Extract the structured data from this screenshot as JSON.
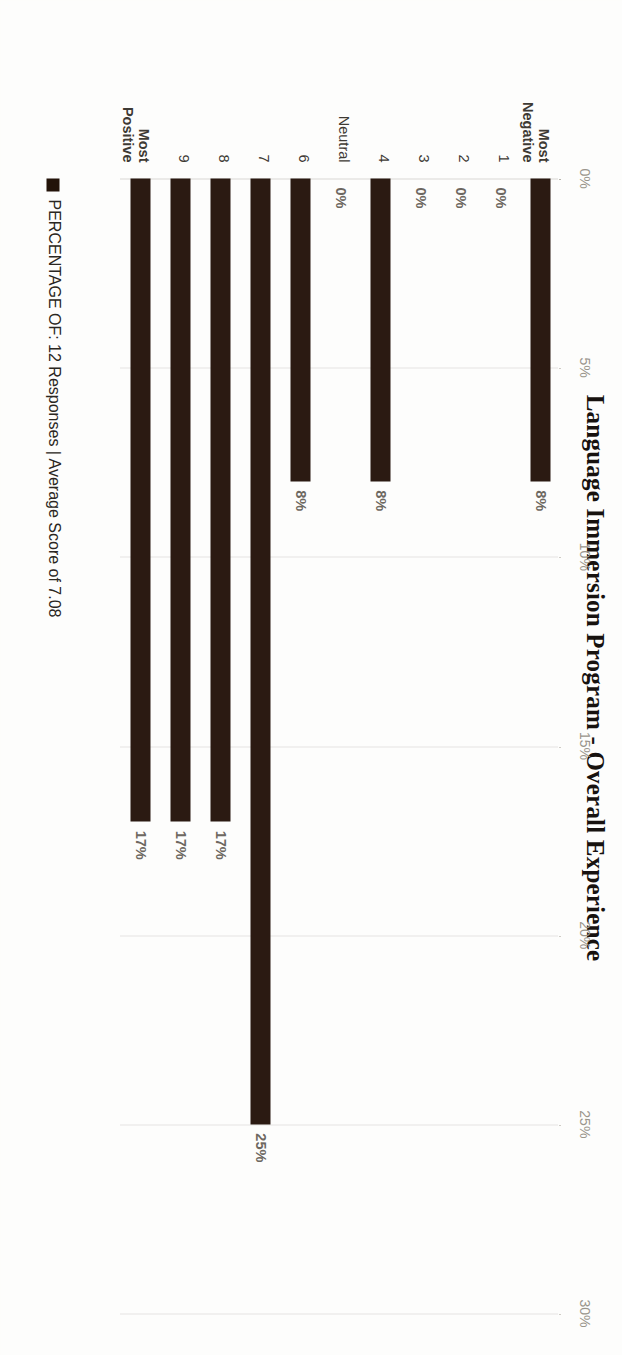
{
  "chart_data": {
    "type": "bar",
    "orientation": "horizontal",
    "title": "Language Immersion Program - Overall Experience",
    "xlabel": "",
    "ylabel": "",
    "xlim": [
      0,
      30
    ],
    "grid": true,
    "legend_position": "bottom-left",
    "categories": [
      "Most\nNegative",
      "1",
      "2",
      "3",
      "4",
      "Neutral",
      "6",
      "7",
      "8",
      "9",
      "Most\nPositive"
    ],
    "values": [
      8,
      0,
      0,
      0,
      8,
      0,
      8,
      25,
      17,
      17,
      17
    ],
    "data_labels": [
      "8%",
      "0%",
      "0%",
      "0%",
      "8%",
      "0%",
      "8%",
      "25%",
      "17%",
      "17%",
      "17%"
    ],
    "xticks": [
      0,
      5,
      10,
      15,
      20,
      25,
      30
    ],
    "xtick_labels": [
      "0%",
      "5%",
      "10%",
      "15%",
      "20%",
      "25%",
      "30%"
    ],
    "series": [
      {
        "name": "PERCENTAGE OF: 12 Responses | Average Score of 7.08",
        "color": "#2b1a12",
        "values": [
          8,
          0,
          0,
          0,
          8,
          0,
          8,
          25,
          17,
          17,
          17
        ]
      }
    ],
    "legend": [
      {
        "label": "PERCENTAGE OF: 12 Responses | Average Score of 7.08",
        "color": "#231309"
      }
    ],
    "annotations": {
      "responses": "12 Responses",
      "average_score": "7.08"
    }
  },
  "colors": {
    "bar": "#2b1a12",
    "gridline": "#cfccc5",
    "tick_text": "#9a958c",
    "label_text": "#6d6861",
    "category_text": "#3e3a34",
    "title_text": "#17120f",
    "background": "#fdfdfb"
  }
}
